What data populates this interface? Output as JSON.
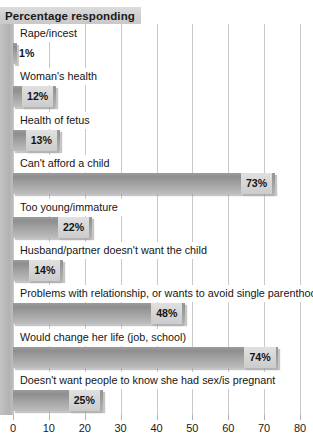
{
  "chart_data": {
    "type": "bar",
    "orientation": "horizontal",
    "title": "Percentage responding",
    "xlabel": "",
    "ylabel": "",
    "xlim": [
      0,
      80
    ],
    "xticks": [
      0,
      10,
      20,
      30,
      40,
      50,
      60,
      70,
      80
    ],
    "xtick_labels": [
      "0",
      "10",
      "20",
      "30",
      "40",
      "50",
      "60",
      "70",
      "80"
    ],
    "grid": true,
    "legend": null,
    "value_suffix": "%",
    "categories": [
      "Rape/incest",
      "Woman's health",
      "Health of fetus",
      "Can't afford a child",
      "Too young/immature",
      "Husband/partner doesn't want the child",
      "Problems with relationship, or wants to avoid single parenthood",
      "Would change her life (job, school)",
      "Doesn't want people to know she had sex/is pregnant"
    ],
    "values": [
      1,
      12,
      13,
      73,
      22,
      14,
      48,
      74,
      25
    ],
    "value_labels": [
      "1%",
      "12%",
      "13%",
      "73%",
      "22%",
      "14%",
      "48%",
      "74%",
      "25%"
    ]
  },
  "style": {
    "bar_color": "#9b9b9b",
    "value_box_color": "#d6d6d6",
    "title_band_color": "#d2d2d2",
    "gridline_color": "#c8c8c8",
    "gutter_color": "#b9b9b9",
    "text_color": "#151515",
    "background": "#ffffff"
  }
}
